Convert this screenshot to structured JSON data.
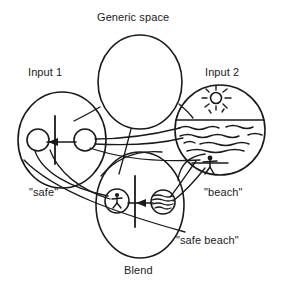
{
  "figure": {
    "type": "conceptual-blending-network",
    "background_color": "#ffffff",
    "stroke_color": "#1a1a1a"
  },
  "spaces": {
    "generic": {
      "label": "Generic space",
      "contents": "empty"
    },
    "input_1": {
      "label": "Input 1",
      "projection_label": "\"safe\"",
      "contents": "two circles separated by a vertical barrier with a left-pointing arrow"
    },
    "input_2": {
      "label": "Input 2",
      "projection_label": "\"beach\"",
      "contents": "beach scene: sun with rays, horizon line, wavy water, stick figure"
    },
    "blend": {
      "label": "Blend",
      "projection_label": "\"safe beach\"",
      "contents": "circle with stick figure, vertical barrier with left-pointing arrow, circle with waves"
    }
  },
  "icons": {
    "sun": "sun-icon",
    "waves": "waves-icon",
    "person": "stick-figure-icon",
    "barrier": "vertical-barrier-icon",
    "arrow": "left-arrow-icon",
    "horizon": "horizon-line-icon"
  }
}
